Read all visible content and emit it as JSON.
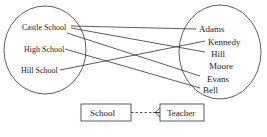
{
  "schools": {
    "items": [
      {
        "label": "Castle School"
      },
      {
        "label": "High School"
      },
      {
        "label": "Hill School"
      }
    ]
  },
  "teachers": {
    "items": [
      {
        "label": "Adams"
      },
      {
        "label": "Kennedy"
      },
      {
        "label": "Hill"
      },
      {
        "label": "Moore"
      },
      {
        "label": "Evans"
      },
      {
        "label": "Bell"
      }
    ]
  },
  "mappings": [
    {
      "from": "Castle School",
      "to": "Adams"
    },
    {
      "from": "Castle School",
      "to": "Hill"
    },
    {
      "from": "Castle School",
      "to": "Evans"
    },
    {
      "from": "High School",
      "to": "Bell"
    },
    {
      "from": "Hill School",
      "to": "Kennedy"
    }
  ],
  "erd": {
    "left_entity": "School",
    "right_entity": "Teacher",
    "relationship": "optional one-to-many"
  },
  "colors": {
    "ink": "#222222",
    "background": "#ffffff"
  }
}
